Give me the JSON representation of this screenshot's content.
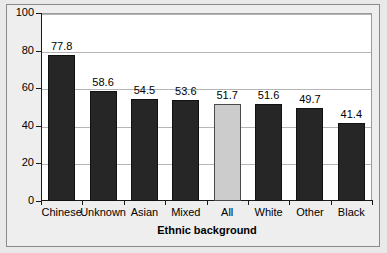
{
  "chart_data": {
    "type": "bar",
    "title": "",
    "xlabel": "Ethnic background",
    "ylabel": "",
    "categories": [
      "Chinese",
      "Unknown",
      "Asian",
      "Mixed",
      "All",
      "White",
      "Other",
      "Black"
    ],
    "values": [
      77.8,
      58.6,
      54.5,
      53.6,
      51.7,
      51.6,
      49.7,
      41.4
    ],
    "value_labels": [
      "77.8",
      "58.6",
      "54.5",
      "53.6",
      "51.7",
      "51.6",
      "49.7",
      "41.4"
    ],
    "bar_styles": [
      "dark",
      "dark",
      "dark",
      "dark",
      "light",
      "dark",
      "dark",
      "dark"
    ],
    "ylim": [
      0,
      100
    ],
    "y_ticks": [
      0,
      20,
      40,
      60,
      80,
      100
    ],
    "y_tick_labels": [
      "0",
      "20",
      "40",
      "60",
      "80",
      "100"
    ],
    "grid": true,
    "legend": false,
    "colors": {
      "bar_dark": "#262626",
      "bar_light": "#cccccc",
      "plot_background": "#ffffff",
      "outer_background": "#eeeeee",
      "gridline": "#b5b5b5",
      "axis": "#1a1a1a",
      "text": "#000000"
    }
  }
}
